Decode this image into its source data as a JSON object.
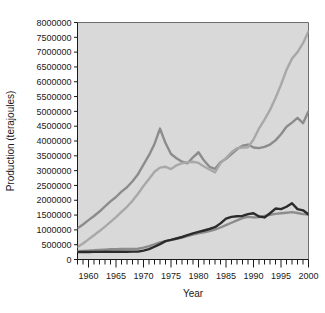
{
  "chart_data": {
    "type": "line",
    "title": "",
    "xlabel": "Year",
    "ylabel": "Production (terajoules)",
    "xlim": [
      1958,
      2000
    ],
    "ylim": [
      0,
      8000000
    ],
    "ytick_step": 500000,
    "xtick_major_step": 5,
    "xtick_minor_step": 1,
    "grid": false,
    "legend": "none",
    "plot_background": "#d9d9d9",
    "ytick_labels": [
      "0",
      "500000",
      "1000000",
      "1500000",
      "2000000",
      "2500000",
      "3000000",
      "3500000",
      "4000000",
      "4500000",
      "5000000",
      "5500000",
      "6000000",
      "6500000",
      "7000000",
      "7500000",
      "8000000"
    ],
    "ytick_values": [
      0,
      500000,
      1000000,
      1500000,
      2000000,
      2500000,
      3000000,
      3500000,
      4000000,
      4500000,
      5000000,
      5500000,
      6000000,
      6500000,
      7000000,
      7500000,
      8000000
    ],
    "xtick_labels": [
      "1960",
      "1965",
      "1970",
      "1975",
      "1980",
      "1985",
      "1990",
      "1995",
      "2000"
    ],
    "xtick_values": [
      1960,
      1965,
      1970,
      1975,
      1980,
      1985,
      1990,
      1995,
      2000
    ],
    "x": [
      1958,
      1959,
      1960,
      1961,
      1962,
      1963,
      1964,
      1965,
      1966,
      1967,
      1968,
      1969,
      1970,
      1971,
      1972,
      1973,
      1974,
      1975,
      1976,
      1977,
      1978,
      1979,
      1980,
      1981,
      1982,
      1983,
      1984,
      1985,
      1986,
      1987,
      1988,
      1989,
      1990,
      1991,
      1992,
      1993,
      1994,
      1995,
      1996,
      1997,
      1998,
      1999,
      2000
    ],
    "series": [
      {
        "name": "series-1",
        "color": "#8c8c8c",
        "width": 2.4,
        "values": [
          1050000,
          1180000,
          1330000,
          1470000,
          1620000,
          1790000,
          1960000,
          2110000,
          2290000,
          2440000,
          2640000,
          2880000,
          3200000,
          3520000,
          3900000,
          4420000,
          3930000,
          3560000,
          3420000,
          3300000,
          3250000,
          3450000,
          3620000,
          3340000,
          3130000,
          3060000,
          3280000,
          3400000,
          3560000,
          3720000,
          3840000,
          3880000,
          3780000,
          3760000,
          3800000,
          3880000,
          4020000,
          4230000,
          4480000,
          4620000,
          4780000,
          4600000,
          5000000
        ]
      },
      {
        "name": "series-2",
        "color": "#a8a8a8",
        "width": 2.4,
        "values": [
          420000,
          540000,
          680000,
          820000,
          960000,
          1110000,
          1270000,
          1430000,
          1610000,
          1780000,
          1980000,
          2220000,
          2480000,
          2720000,
          2960000,
          3100000,
          3130000,
          3050000,
          3180000,
          3250000,
          3280000,
          3300000,
          3260000,
          3140000,
          3040000,
          2940000,
          3250000,
          3420000,
          3620000,
          3760000,
          3780000,
          3790000,
          4050000,
          4420000,
          4720000,
          5050000,
          5450000,
          5900000,
          6400000,
          6780000,
          7000000,
          7300000,
          7700000
        ]
      },
      {
        "name": "series-3",
        "color": "#8c8c8c",
        "width": 2.4,
        "values": [
          280000,
          290000,
          300000,
          310000,
          325000,
          335000,
          345000,
          350000,
          355000,
          358000,
          360000,
          362000,
          400000,
          450000,
          510000,
          580000,
          620000,
          660000,
          700000,
          740000,
          790000,
          840000,
          880000,
          920000,
          960000,
          1010000,
          1080000,
          1160000,
          1240000,
          1320000,
          1400000,
          1440000,
          1420000,
          1430000,
          1470000,
          1510000,
          1540000,
          1560000,
          1580000,
          1600000,
          1570000,
          1530000,
          1520000
        ]
      },
      {
        "name": "series-4",
        "color": "#2b2b2b",
        "width": 2.4,
        "values": [
          250000,
          252000,
          255000,
          256000,
          258000,
          260000,
          261000,
          262000,
          263000,
          264000,
          265000,
          266000,
          300000,
          350000,
          430000,
          520000,
          620000,
          660000,
          710000,
          760000,
          820000,
          880000,
          930000,
          980000,
          1030000,
          1090000,
          1220000,
          1380000,
          1440000,
          1460000,
          1470000,
          1530000,
          1560000,
          1450000,
          1420000,
          1560000,
          1720000,
          1700000,
          1780000,
          1900000,
          1700000,
          1660000,
          1520000
        ]
      }
    ]
  }
}
